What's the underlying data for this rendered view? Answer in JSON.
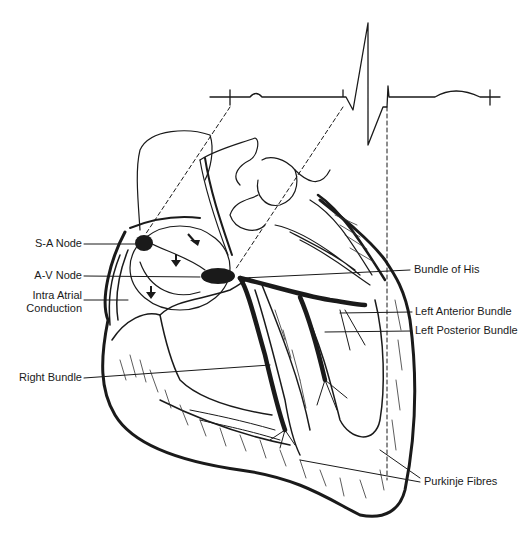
{
  "diagram": {
    "ink_color": "#1a1a1a",
    "background": "#ffffff",
    "labels_left": [
      {
        "id": "sa-node",
        "text": "S-A Node"
      },
      {
        "id": "av-node",
        "text": "A-V Node"
      },
      {
        "id": "intra-atrial-1",
        "text": "Intra Atrial"
      },
      {
        "id": "intra-atrial-2",
        "text": "Conduction"
      },
      {
        "id": "right-bundle",
        "text": "Right Bundle"
      }
    ],
    "labels_right": [
      {
        "id": "bundle-of-his",
        "text": "Bundle of His"
      },
      {
        "id": "left-anterior-bundle",
        "text": "Left Anterior Bundle"
      },
      {
        "id": "left-posterior-bundle",
        "text": "Left Posterior Bundle"
      },
      {
        "id": "purkinje-fibres",
        "text": "Purkinje Fibres"
      }
    ],
    "ecg": {
      "waves": [
        "P wave",
        "QRS complex",
        "T wave"
      ]
    }
  }
}
